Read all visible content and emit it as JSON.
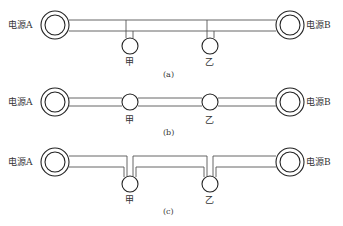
{
  "diagram": {
    "panels": [
      {
        "id": "a",
        "caption": "(a)",
        "source_left": "电源A",
        "source_right": "电源B",
        "load_1": "甲",
        "load_2": "乙",
        "connection": "T-connection (loads tapped off double line)"
      },
      {
        "id": "b",
        "caption": "(b)",
        "source_left": "电源A",
        "source_right": "电源B",
        "load_1": "甲",
        "load_2": "乙",
        "connection": "in-line (loads in series on double line)"
      },
      {
        "id": "c",
        "caption": "(c)",
        "source_left": "电源A",
        "source_right": "电源B",
        "load_1": "甲",
        "load_2": "乙",
        "connection": "loop in-out (line looped through loads)"
      }
    ],
    "line_color": "#555555",
    "symbol_color": "#222222"
  }
}
